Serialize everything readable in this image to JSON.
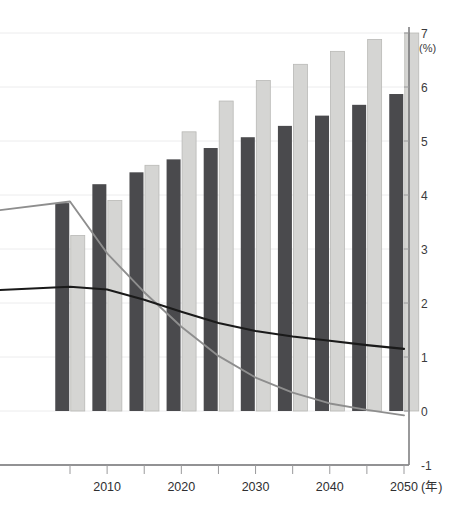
{
  "header": {
    "faint_top_text": "",
    "page_title": ""
  },
  "chart_data": {
    "type": "bar",
    "title": "",
    "subtitle": "",
    "xlabel": "(年)",
    "ylabel": "(%)",
    "ylim": [
      -1,
      7
    ],
    "ytick_step": 1,
    "grid": true,
    "legend_position": "none",
    "x": [
      2005,
      2010,
      2015,
      2020,
      2025,
      2030,
      2035,
      2040,
      2045,
      2050
    ],
    "xtick_labels": [
      "2010",
      "2020",
      "2030",
      "2040",
      "2050"
    ],
    "xtick_values": [
      2010,
      2020,
      2030,
      2040,
      2050
    ],
    "ytick_labels": [
      "7",
      "6",
      "5",
      "4",
      "3",
      "2",
      "1",
      "0",
      "-1"
    ],
    "ytick_values": [
      7,
      6,
      5,
      4,
      3,
      2,
      1,
      0,
      -1
    ],
    "series": [
      {
        "name": "bar-series-dark",
        "kind": "bar",
        "color": "#4a4a4d",
        "categories": [
          2005,
          2010,
          2015,
          2020,
          2025,
          2030,
          2035,
          2040,
          2045,
          2050
        ],
        "values": [
          3.85,
          4.2,
          4.42,
          4.66,
          4.87,
          5.07,
          5.28,
          5.47,
          5.67,
          5.87
        ]
      },
      {
        "name": "bar-series-light",
        "kind": "bar",
        "color": "#d5d5d3",
        "categories": [
          2005,
          2010,
          2015,
          2020,
          2025,
          2030,
          2035,
          2040,
          2045,
          2050
        ],
        "values": [
          3.25,
          3.9,
          4.55,
          5.17,
          5.74,
          6.12,
          6.42,
          6.66,
          6.88,
          7.0
        ]
      },
      {
        "name": "line-series-gray",
        "kind": "line",
        "color": "#8e8e8e",
        "x": [
          2000,
          2005,
          2010,
          2015,
          2020,
          2025,
          2030,
          2035,
          2040,
          2045,
          2050
        ],
        "values": [
          3.72,
          3.88,
          2.92,
          2.2,
          1.56,
          1.02,
          0.62,
          0.34,
          0.14,
          0.02,
          -0.08
        ]
      },
      {
        "name": "line-series-black",
        "kind": "line",
        "color": "#1a1a1a",
        "x": [
          2000,
          2005,
          2010,
          2015,
          2020,
          2025,
          2030,
          2035,
          2040,
          2045,
          2050
        ],
        "values": [
          2.24,
          2.3,
          2.25,
          2.06,
          1.84,
          1.63,
          1.48,
          1.38,
          1.3,
          1.22,
          1.15
        ]
      }
    ]
  }
}
